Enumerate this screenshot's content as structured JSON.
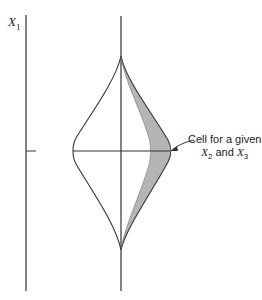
{
  "figure": {
    "axis_label": {
      "symbol": "X",
      "subscript": "1"
    },
    "annotation": {
      "line1": "Cell for a given",
      "x2_symbol": "X",
      "x2_subscript": "2",
      "and_text": "and",
      "x3_symbol": "X",
      "x3_subscript": "3"
    },
    "colors": {
      "line": "#333333",
      "shading": "#b5b5b5",
      "background": "#ffffff"
    }
  }
}
